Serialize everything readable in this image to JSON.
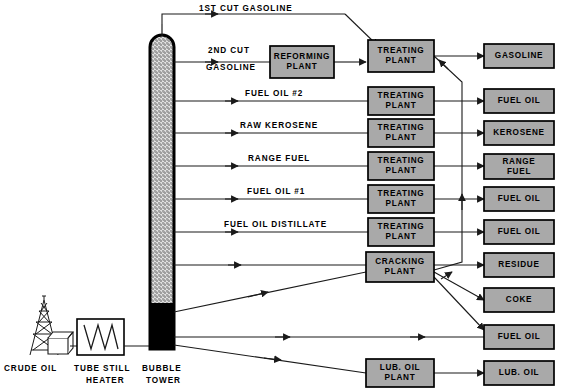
{
  "diagram": {
    "colors": {
      "box_fill": "#a9a9a9",
      "box_stroke": "#000000",
      "line": "#1a1a1a",
      "tower_packing": "#d9d9d9",
      "tower_residue": "#000000",
      "background": "#ffffff"
    }
  },
  "source": {
    "derrick_label": "CRUDE OIL",
    "heater_label_line1": "TUBE STILL",
    "heater_label_line2": "HEATER",
    "tower_label_line1": "BUBBLE",
    "tower_label_line2": "TOWER"
  },
  "stream_labels": [
    {
      "id": "s1",
      "text": "1ST CUT GASOLINE"
    },
    {
      "id": "s2a",
      "text": "2ND CUT"
    },
    {
      "id": "s2b",
      "text": "GASOLINE"
    },
    {
      "id": "s3",
      "text": "FUEL OIL #2"
    },
    {
      "id": "s4",
      "text": "RAW KEROSENE"
    },
    {
      "id": "s5",
      "text": "RANGE FUEL"
    },
    {
      "id": "s6",
      "text": "FUEL OIL #1"
    },
    {
      "id": "s7",
      "text": "FUEL OIL DISTILLATE"
    }
  ],
  "plants": [
    {
      "id": "p-reforming",
      "line1": "REFORMING",
      "line2": "PLANT"
    },
    {
      "id": "p-treating-1",
      "line1": "TREATING",
      "line2": "PLANT"
    },
    {
      "id": "p-treating-2",
      "line1": "TREATING",
      "line2": "PLANT"
    },
    {
      "id": "p-treating-3",
      "line1": "TREATING",
      "line2": "PLANT"
    },
    {
      "id": "p-treating-4",
      "line1": "TREATING",
      "line2": "PLANT"
    },
    {
      "id": "p-treating-5",
      "line1": "TREATING",
      "line2": "PLANT"
    },
    {
      "id": "p-treating-6",
      "line1": "TREATING",
      "line2": "PLANT"
    },
    {
      "id": "p-cracking",
      "line1": "CRACKING",
      "line2": "PLANT"
    },
    {
      "id": "p-luboil",
      "line1": "LUB. OIL",
      "line2": "PLANT"
    }
  ],
  "products": [
    {
      "id": "prod-gasoline",
      "line1": "GASOLINE",
      "line2": ""
    },
    {
      "id": "prod-fueloil-1",
      "line1": "FUEL OIL",
      "line2": ""
    },
    {
      "id": "prod-kerosene",
      "line1": "KEROSENE",
      "line2": ""
    },
    {
      "id": "prod-rangefuel",
      "line1": "RANGE",
      "line2": "FUEL"
    },
    {
      "id": "prod-fueloil-2",
      "line1": "FUEL OIL",
      "line2": ""
    },
    {
      "id": "prod-fueloil-3",
      "line1": "FUEL OIL",
      "line2": ""
    },
    {
      "id": "prod-residue",
      "line1": "RESIDUE",
      "line2": ""
    },
    {
      "id": "prod-coke",
      "line1": "COKE",
      "line2": ""
    },
    {
      "id": "prod-fueloil-4",
      "line1": "FUEL OIL",
      "line2": ""
    },
    {
      "id": "prod-luboil",
      "line1": "LUB. OIL",
      "line2": ""
    }
  ]
}
